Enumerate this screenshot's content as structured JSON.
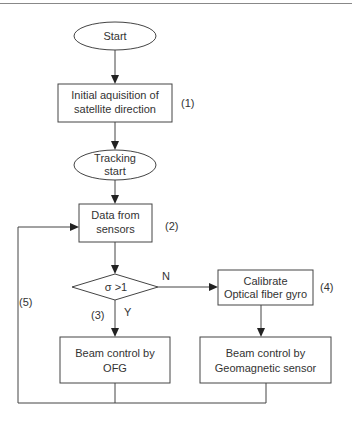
{
  "diagram": {
    "type": "flowchart",
    "nodes": {
      "start": {
        "label": "Start",
        "shape": "ellipse"
      },
      "initial": {
        "line1": "Initial aquisition of",
        "line2": "satellite direction",
        "shape": "rectangle",
        "step": "(1)"
      },
      "tracking": {
        "line1": "Tracking",
        "line2": "start",
        "shape": "ellipse"
      },
      "data": {
        "line1": "Data from",
        "line2": "sensors",
        "shape": "rectangle",
        "step": "(2)"
      },
      "decision": {
        "label": "σ >1",
        "shape": "diamond",
        "yes": "Y",
        "no": "N"
      },
      "calibrate": {
        "line1": "Calibrate",
        "line2": "Optical fiber gyro",
        "shape": "rectangle",
        "step": "(4)"
      },
      "beam_ofg": {
        "line1": "Beam control by",
        "line2": "OFG",
        "shape": "rectangle"
      },
      "beam_geo": {
        "line1": "Beam control by",
        "line2": "Geomagnetic sensor",
        "shape": "rectangle"
      }
    },
    "step_labels": {
      "yes_branch": "(3)",
      "loop": "(5)"
    },
    "edges": [
      {
        "from": "start",
        "to": "initial"
      },
      {
        "from": "initial",
        "to": "tracking"
      },
      {
        "from": "tracking",
        "to": "data"
      },
      {
        "from": "data",
        "to": "decision"
      },
      {
        "from": "decision",
        "to": "beam_ofg",
        "label": "Y"
      },
      {
        "from": "decision",
        "to": "calibrate",
        "label": "N"
      },
      {
        "from": "calibrate",
        "to": "beam_geo"
      },
      {
        "from": "beam_ofg",
        "to": "data",
        "label": "loop"
      },
      {
        "from": "beam_geo",
        "to": "data",
        "label": "loop"
      }
    ]
  }
}
